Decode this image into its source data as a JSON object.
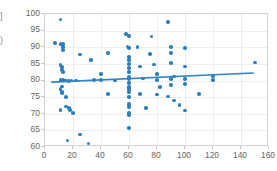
{
  "axis_title_fragments": {
    "top_fragment": "]",
    "bottom_fragment": ")"
  },
  "chart_data": {
    "type": "scatter",
    "title": "",
    "xlabel": "",
    "ylabel": "",
    "xlim": [
      0,
      160
    ],
    "ylim": [
      60,
      100
    ],
    "xticks": [
      0,
      20,
      40,
      60,
      80,
      100,
      120,
      140,
      160
    ],
    "yticks": [
      60,
      65,
      70,
      75,
      80,
      85,
      90,
      95,
      100
    ],
    "grid": true,
    "legend": "none",
    "marker_color": "#2e7ebb",
    "marker_size": 3.6,
    "series": [
      {
        "name": "observations",
        "type": "scatter",
        "points": [
          [
            11,
            98.4
          ],
          [
            7,
            91.2
          ],
          [
            11,
            91.0
          ],
          [
            13,
            91.0
          ],
          [
            13,
            90.0
          ],
          [
            13,
            89.2
          ],
          [
            25,
            87.8
          ],
          [
            33,
            86.2
          ],
          [
            11,
            84.6
          ],
          [
            12,
            84.0
          ],
          [
            12,
            83.2
          ],
          [
            13,
            82.6
          ],
          [
            11,
            80.2
          ],
          [
            13,
            80.2
          ],
          [
            15,
            80.0
          ],
          [
            17,
            79.8
          ],
          [
            19,
            80.0
          ],
          [
            12,
            78.2
          ],
          [
            11,
            77.4
          ],
          [
            12,
            76.6
          ],
          [
            12,
            76.2
          ],
          [
            15,
            75.0
          ],
          [
            11,
            71.2
          ],
          [
            15,
            72.2
          ],
          [
            17,
            71.8
          ],
          [
            18,
            71.2
          ],
          [
            20,
            70.2
          ],
          [
            16,
            62.0
          ],
          [
            25,
            63.8
          ],
          [
            31,
            61.0
          ],
          [
            45,
            88.2
          ],
          [
            40,
            82.0
          ],
          [
            40,
            80.2
          ],
          [
            45,
            76.0
          ],
          [
            58,
            94.0
          ],
          [
            60,
            93.4
          ],
          [
            59,
            90.2
          ],
          [
            60,
            89.8
          ],
          [
            60,
            87.0
          ],
          [
            60,
            86.2
          ],
          [
            60,
            85.0
          ],
          [
            60,
            83.8
          ],
          [
            60,
            82.6
          ],
          [
            60,
            81.0
          ],
          [
            60,
            80.4
          ],
          [
            60,
            79.2
          ],
          [
            60,
            78.0
          ],
          [
            60,
            77.4
          ],
          [
            60,
            76.6
          ],
          [
            60,
            75.0
          ],
          [
            60,
            73.0
          ],
          [
            60,
            72.0
          ],
          [
            60,
            70.2
          ],
          [
            60,
            69.6
          ],
          [
            60,
            65.8
          ],
          [
            66,
            90.0
          ],
          [
            68,
            84.2
          ],
          [
            70,
            80.6
          ],
          [
            68,
            76.0
          ],
          [
            72,
            71.8
          ],
          [
            76,
            93.2
          ],
          [
            75,
            88.0
          ],
          [
            78,
            84.8
          ],
          [
            80,
            82.0
          ],
          [
            80,
            80.2
          ],
          [
            82,
            78.0
          ],
          [
            80,
            75.8
          ],
          [
            88,
            97.6
          ],
          [
            90,
            90.0
          ],
          [
            90,
            88.2
          ],
          [
            90,
            85.2
          ],
          [
            92,
            81.2
          ],
          [
            90,
            80.4
          ],
          [
            90,
            78.6
          ],
          [
            88,
            75.2
          ],
          [
            92,
            74.0
          ],
          [
            96,
            72.6
          ],
          [
            100,
            89.8
          ],
          [
            100,
            84.2
          ],
          [
            100,
            80.4
          ],
          [
            100,
            79.0
          ],
          [
            100,
            71.0
          ],
          [
            110,
            76.0
          ],
          [
            120,
            81.4
          ],
          [
            120,
            80.2
          ],
          [
            150,
            85.4
          ],
          [
            50,
            80.0
          ],
          [
            35,
            80.2
          ],
          [
            22,
            80.0
          ]
        ]
      },
      {
        "name": "trendline",
        "type": "line",
        "points": [
          [
            5,
            79.2
          ],
          [
            150,
            82.0
          ]
        ],
        "color": "#3184c4",
        "width": 1.6
      }
    ]
  }
}
